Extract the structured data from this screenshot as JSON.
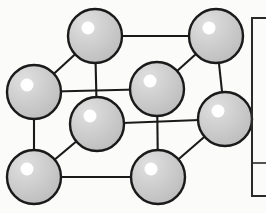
{
  "figure": {
    "kind": "cubic-unit-cell-ball-and-stick",
    "background_color": "#fbfbfa"
  },
  "style": {
    "atom_fill": "#cccccc",
    "atom_stroke": "#1a1a1a",
    "atom_stroke_width": 2.4,
    "atom_highlight_color": "#ffffff",
    "bond_color": "#1a1a1a",
    "bond_width": 2.1,
    "frame_color": "#2a2a2a",
    "frame_width": 2.0
  },
  "atoms": [
    {
      "id": "back-top-left",
      "label": "atom-back-top-left",
      "cx": 95,
      "cy": 36,
      "r": 27,
      "hx": 88,
      "hy": 28,
      "hr": 6.5
    },
    {
      "id": "back-top-right",
      "label": "atom-back-top-right",
      "cx": 216,
      "cy": 36,
      "r": 27,
      "hx": 209,
      "hy": 28,
      "hr": 6.5
    },
    {
      "id": "back-bottom-left",
      "label": "atom-back-bottom-left",
      "cx": 34,
      "cy": 92,
      "r": 27,
      "hx": 27,
      "hy": 85,
      "hr": 6.5
    },
    {
      "id": "center-back",
      "label": "atom-front-top-right",
      "cx": 157,
      "cy": 89,
      "r": 27,
      "hx": 150,
      "hy": 81,
      "hr": 6.5
    },
    {
      "id": "front-top-left",
      "label": "atom-front-top-left",
      "cx": 97,
      "cy": 124,
      "r": 27,
      "hx": 90,
      "hy": 116,
      "hr": 6.5
    },
    {
      "id": "front-mid-right",
      "label": "atom-mid-right",
      "cx": 225,
      "cy": 119,
      "r": 27,
      "hx": 218,
      "hy": 111,
      "hr": 6.5
    },
    {
      "id": "front-bottom-left",
      "label": "atom-front-bottom-left",
      "cx": 34,
      "cy": 177,
      "r": 27,
      "hx": 27,
      "hy": 169,
      "hr": 6.5
    },
    {
      "id": "front-bottom-mid",
      "label": "atom-front-bottom-mid",
      "cx": 158,
      "cy": 177,
      "r": 27,
      "hx": 151,
      "hy": 169,
      "hr": 6.5
    }
  ],
  "bonds": [
    {
      "id": "bond-top-back",
      "x1": 95,
      "y1": 36,
      "x2": 216,
      "y2": 36
    },
    {
      "id": "bond-topleft-left",
      "x1": 95,
      "y1": 36,
      "x2": 34,
      "y2": 92
    },
    {
      "id": "bond-topleft-down",
      "x1": 95,
      "y1": 36,
      "x2": 97,
      "y2": 124
    },
    {
      "id": "bond-topright-center",
      "x1": 216,
      "y1": 36,
      "x2": 157,
      "y2": 89
    },
    {
      "id": "bond-topright-down",
      "x1": 216,
      "y1": 36,
      "x2": 225,
      "y2": 119
    },
    {
      "id": "bond-left-center",
      "x1": 34,
      "y1": 92,
      "x2": 157,
      "y2": 89
    },
    {
      "id": "bond-left-down",
      "x1": 34,
      "y1": 92,
      "x2": 34,
      "y2": 177
    },
    {
      "id": "bond-center-down",
      "x1": 157,
      "y1": 89,
      "x2": 158,
      "y2": 177
    },
    {
      "id": "bond-fronttop-right",
      "x1": 97,
      "y1": 124,
      "x2": 225,
      "y2": 119
    },
    {
      "id": "bond-fronttop-bottom",
      "x1": 97,
      "y1": 124,
      "x2": 34,
      "y2": 177
    },
    {
      "id": "bond-bottom-front",
      "x1": 34,
      "y1": 177,
      "x2": 158,
      "y2": 177
    },
    {
      "id": "bond-bottommid-right",
      "x1": 158,
      "y1": 177,
      "x2": 225,
      "y2": 119
    }
  ],
  "side_frame": {
    "label": "legend-box",
    "x": 252,
    "y": 18,
    "width": 40,
    "height": 178,
    "tick_y": 163,
    "tick_x1": 252,
    "tick_x2": 266
  }
}
